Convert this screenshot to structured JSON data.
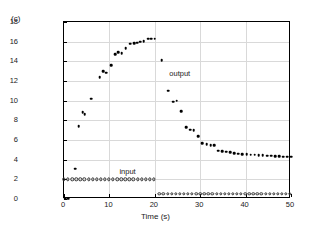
{
  "panel_label": "(c)",
  "chart_data": {
    "type": "scatter",
    "title": "",
    "xlabel": "Time (s)",
    "ylabel": "Amplitude",
    "xlim": [
      0,
      50
    ],
    "ylim": [
      0,
      18
    ],
    "xticks": [
      0,
      10,
      20,
      30,
      40,
      50
    ],
    "yticks": [
      0,
      2,
      4,
      6,
      8,
      10,
      12,
      14,
      16,
      18
    ],
    "grid": true,
    "legend_position": "inline-annotations",
    "annotations": [
      {
        "text": "output",
        "x": 25.5,
        "y": 12.8
      },
      {
        "text": "input",
        "x": 14.0,
        "y": 2.85
      }
    ],
    "series": [
      {
        "name": "output",
        "marker": "filled-circle",
        "color": "#000000",
        "points": [
          [
            0.3,
            0.05
          ],
          [
            0.9,
            0.05
          ],
          [
            2.5,
            3.1
          ],
          [
            3.2,
            7.4
          ],
          [
            4.1,
            8.8
          ],
          [
            4.6,
            8.65
          ],
          [
            6.0,
            10.2
          ],
          [
            7.9,
            12.4
          ],
          [
            8.7,
            13.0
          ],
          [
            9.3,
            12.85
          ],
          [
            10.4,
            13.6
          ],
          [
            11.3,
            14.7
          ],
          [
            12.0,
            14.95
          ],
          [
            12.7,
            14.85
          ],
          [
            13.6,
            15.35
          ],
          [
            14.6,
            15.8
          ],
          [
            15.4,
            15.85
          ],
          [
            16.1,
            15.9
          ],
          [
            16.8,
            16.0
          ],
          [
            17.6,
            16.05
          ],
          [
            18.5,
            16.3
          ],
          [
            19.2,
            16.3
          ],
          [
            20.0,
            16.3
          ],
          [
            21.5,
            14.1
          ],
          [
            23.0,
            11.0
          ],
          [
            24.1,
            9.9
          ],
          [
            24.8,
            10.0
          ],
          [
            25.8,
            8.9
          ],
          [
            26.9,
            7.3
          ],
          [
            27.8,
            7.05
          ],
          [
            28.6,
            7.0
          ],
          [
            29.6,
            6.4
          ],
          [
            30.5,
            5.7
          ],
          [
            31.4,
            5.55
          ],
          [
            32.3,
            5.5
          ],
          [
            33.1,
            5.45
          ],
          [
            34.0,
            4.9
          ],
          [
            34.9,
            4.85
          ],
          [
            35.7,
            4.8
          ],
          [
            36.6,
            4.75
          ],
          [
            37.5,
            4.65
          ],
          [
            38.4,
            4.6
          ],
          [
            39.3,
            4.55
          ],
          [
            40.2,
            4.55
          ],
          [
            41.1,
            4.5
          ],
          [
            42.0,
            4.5
          ],
          [
            42.9,
            4.45
          ],
          [
            43.8,
            4.45
          ],
          [
            44.7,
            4.4
          ],
          [
            45.6,
            4.4
          ],
          [
            46.5,
            4.35
          ],
          [
            47.4,
            4.35
          ],
          [
            48.3,
            4.3
          ],
          [
            49.2,
            4.3
          ],
          [
            50.0,
            4.3
          ]
        ]
      },
      {
        "name": "input",
        "marker": "open-circle",
        "color": "#333333",
        "points": [
          [
            0.0,
            2.0
          ],
          [
            0.9,
            2.0
          ],
          [
            1.8,
            2.0
          ],
          [
            2.7,
            2.0
          ],
          [
            3.6,
            2.0
          ],
          [
            4.5,
            2.0
          ],
          [
            5.4,
            2.0
          ],
          [
            6.3,
            2.0
          ],
          [
            7.2,
            2.0
          ],
          [
            8.1,
            2.0
          ],
          [
            9.0,
            2.0
          ],
          [
            9.9,
            2.0
          ],
          [
            10.8,
            2.0
          ],
          [
            11.7,
            2.0
          ],
          [
            12.6,
            2.0
          ],
          [
            13.5,
            2.0
          ],
          [
            14.4,
            2.0
          ],
          [
            15.3,
            2.0
          ],
          [
            16.2,
            2.0
          ],
          [
            17.1,
            2.0
          ],
          [
            18.0,
            2.0
          ],
          [
            18.9,
            2.0
          ],
          [
            19.8,
            2.0
          ],
          [
            21.0,
            0.5
          ],
          [
            21.9,
            0.5
          ],
          [
            22.8,
            0.5
          ],
          [
            23.7,
            0.5
          ],
          [
            24.6,
            0.5
          ],
          [
            25.5,
            0.5
          ],
          [
            26.4,
            0.5
          ],
          [
            27.3,
            0.5
          ],
          [
            28.2,
            0.5
          ],
          [
            29.1,
            0.5
          ],
          [
            30.0,
            0.5
          ],
          [
            30.9,
            0.5
          ],
          [
            31.8,
            0.5
          ],
          [
            32.7,
            0.5
          ],
          [
            33.6,
            0.5
          ],
          [
            34.5,
            0.5
          ],
          [
            35.4,
            0.5
          ],
          [
            36.3,
            0.5
          ],
          [
            37.2,
            0.5
          ],
          [
            38.1,
            0.5
          ],
          [
            39.0,
            0.5
          ],
          [
            39.9,
            0.5
          ],
          [
            40.8,
            0.5
          ],
          [
            41.7,
            0.5
          ],
          [
            42.6,
            0.5
          ],
          [
            43.5,
            0.5
          ],
          [
            44.4,
            0.5
          ],
          [
            45.3,
            0.5
          ],
          [
            46.2,
            0.5
          ],
          [
            47.1,
            0.5
          ],
          [
            48.0,
            0.5
          ],
          [
            48.9,
            0.5
          ],
          [
            49.8,
            0.5
          ]
        ]
      }
    ]
  }
}
